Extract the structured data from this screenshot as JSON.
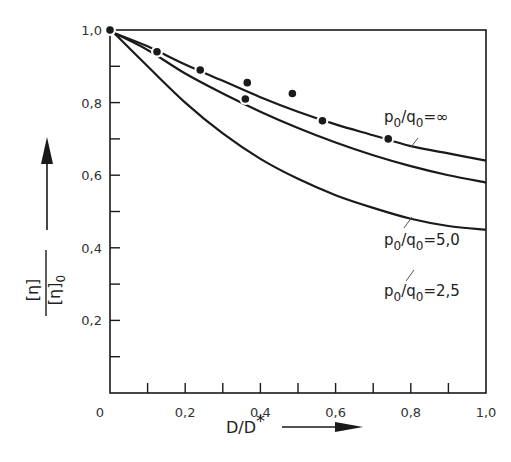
{
  "chart_data": {
    "type": "line",
    "title": "",
    "xlabel": "D/D*",
    "ylabel": "[η]/[η]0",
    "xlim": [
      0,
      1.0
    ],
    "ylim": [
      0,
      1.0
    ],
    "grid": false,
    "legend_position": "inline labels at right",
    "x_ticks": [
      0,
      0.1,
      0.2,
      0.3,
      0.4,
      0.5,
      0.6,
      0.7,
      0.8,
      0.9,
      1.0
    ],
    "x_tick_labels": [
      "0",
      "",
      "0,2",
      "",
      "0,4",
      "",
      "0,6",
      "",
      "0,8",
      "",
      "1,0"
    ],
    "y_ticks": [
      0,
      0.1,
      0.2,
      0.3,
      0.4,
      0.5,
      0.6,
      0.7,
      0.8,
      0.9,
      1.0
    ],
    "y_tick_labels": [
      "",
      "",
      "0,2",
      "",
      "0,4",
      "",
      "0,6",
      "",
      "0,8",
      "",
      "1,0"
    ],
    "x": [
      0,
      0.1,
      0.2,
      0.3,
      0.4,
      0.5,
      0.6,
      0.7,
      0.8,
      0.9,
      1.0
    ],
    "series": [
      {
        "name": "p0/q0 = ∞",
        "label_main": "p",
        "label_sub1": "0",
        "label_div": "/q",
        "label_sub2": "0",
        "label_eq": "=∞",
        "values": [
          1.0,
          0.955,
          0.905,
          0.86,
          0.815,
          0.775,
          0.74,
          0.71,
          0.68,
          0.66,
          0.64
        ]
      },
      {
        "name": "p0/q0 = 5.0",
        "label_main": "p",
        "label_sub1": "0",
        "label_div": "/q",
        "label_sub2": "0",
        "label_eq": "=5,0",
        "values": [
          1.0,
          0.945,
          0.88,
          0.825,
          0.775,
          0.73,
          0.69,
          0.655,
          0.625,
          0.6,
          0.58
        ]
      },
      {
        "name": "p0/q0 = 2.5",
        "label_main": "p",
        "label_sub1": "0",
        "label_div": "/q",
        "label_sub2": "0",
        "label_eq": "=2,5",
        "values": [
          1.0,
          0.9,
          0.8,
          0.715,
          0.645,
          0.59,
          0.545,
          0.51,
          0.48,
          0.46,
          0.45
        ]
      }
    ],
    "scatter_points": [
      {
        "x": 0.0,
        "y": 1.0
      },
      {
        "x": 0.125,
        "y": 0.94
      },
      {
        "x": 0.24,
        "y": 0.89
      },
      {
        "x": 0.365,
        "y": 0.855
      },
      {
        "x": 0.36,
        "y": 0.81
      },
      {
        "x": 0.485,
        "y": 0.825
      },
      {
        "x": 0.565,
        "y": 0.75
      },
      {
        "x": 0.74,
        "y": 0.7
      }
    ]
  },
  "axes": {
    "x_title": "D/D",
    "x_title_star": "*",
    "y_title_num": "[η]",
    "y_title_den": "[η]",
    "y_title_den_sub": "0"
  },
  "colors": {
    "ink": "#1a1a1a",
    "background": "#ffffff"
  }
}
